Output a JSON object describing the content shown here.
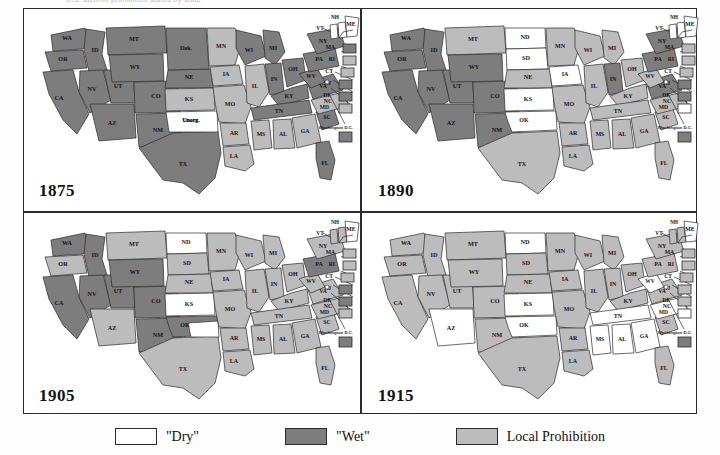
{
  "figure": {
    "top_sliver_text": "U.S. alcohol prohibition status by state",
    "legend": {
      "items": [
        {
          "label": "\"Dry\"",
          "swatch_name": "dry-swatch",
          "color": "#ffffff"
        },
        {
          "label": "\"Wet\"",
          "swatch_name": "wet-swatch",
          "color": "#7d7d7d"
        },
        {
          "label": "Local Prohibition",
          "swatch_name": "local-prohibition-swatch",
          "color": "#bcbcbc"
        }
      ]
    },
    "colors": {
      "dry": "#ffffff",
      "wet": "#7d7d7d",
      "local": "#bcbcbc",
      "outline": "#2b2b2b",
      "frame": "#2b2b2b"
    },
    "inset_box_labels": [
      "MA",
      "RI",
      "CT",
      "NJ",
      "DE",
      "MD"
    ],
    "dc_label": "Washington D.C."
  },
  "panels": [
    {
      "id": "panel-1875",
      "year": "1875",
      "states": {
        "WA": "wet",
        "OR": "wet",
        "ID": "wet",
        "MT": "wet",
        "WY": "wet",
        "CA": "wet",
        "NV": "wet",
        "UT": "wet",
        "CO": "wet",
        "AZ": "wet",
        "NM": "wet",
        "TX": "wet",
        "DAK": "wet",
        "NE": "wet",
        "KS": "local",
        "UNORG": "dry",
        "MN": "local",
        "IA": "local",
        "MO": "local",
        "AR": "local",
        "LA": "local",
        "WI": "wet",
        "IL": "local",
        "MI": "wet",
        "IN": "wet",
        "OH": "wet",
        "KY": "wet",
        "TN": "wet",
        "MS": "local",
        "AL": "local",
        "GA": "local",
        "FL": "wet",
        "SC": "wet",
        "NC": "local",
        "VA": "wet",
        "WV": "wet",
        "PA": "wet",
        "NY": "wet",
        "VT": "dry",
        "NH": "dry",
        "ME": "dry",
        "MA": "wet",
        "RI": "local",
        "CT": "local",
        "NJ": "wet",
        "DE": "wet",
        "MD": "local",
        "DC": "wet"
      },
      "labels": {
        "WA": "WA",
        "OR": "OR",
        "ID": "ID",
        "MT": "MT",
        "WY": "WY",
        "CA": "CA",
        "NV": "NV",
        "UT": "UT",
        "CO": "CO",
        "AZ": "AZ",
        "NM": "NM",
        "TX": "TX",
        "DAK": "Dak.",
        "NE": "NE",
        "KS": "KS",
        "UNORG": "Unorg.",
        "MN": "MN",
        "IA": "IA",
        "MO": "MO",
        "AR": "AR",
        "LA": "LA",
        "WI": "WI",
        "IL": "IL",
        "MI": "MI",
        "IN": "IN",
        "OH": "OH",
        "KY": "KY",
        "TN": "TN",
        "MS": "MS",
        "AL": "AL",
        "GA": "GA",
        "FL": "FL",
        "SC": "SC",
        "NC": "NC",
        "VA": "VA",
        "WV": "WV",
        "PA": "PA",
        "NY": "NY",
        "VT": "VT",
        "NH": "NH",
        "ME": "ME"
      }
    },
    {
      "id": "panel-1890",
      "year": "1890",
      "states": {
        "WA": "wet",
        "OR": "wet",
        "ID": "wet",
        "MT": "local",
        "WY": "wet",
        "CA": "wet",
        "NV": "wet",
        "UT": "wet",
        "CO": "wet",
        "AZ": "wet",
        "NM": "wet",
        "TX": "local",
        "ND": "dry",
        "SD": "dry",
        "NE": "local",
        "KS": "dry",
        "OK": "dry",
        "MN": "local",
        "IA": "dry",
        "MO": "local",
        "AR": "local",
        "LA": "local",
        "WI": "local",
        "IL": "local",
        "MI": "local",
        "IN": "wet",
        "OH": "local",
        "KY": "local",
        "TN": "local",
        "MS": "local",
        "AL": "local",
        "GA": "local",
        "FL": "local",
        "SC": "local",
        "NC": "local",
        "VA": "wet",
        "WV": "local",
        "PA": "wet",
        "NY": "wet",
        "VT": "dry",
        "NH": "dry",
        "ME": "dry",
        "MA": "local",
        "RI": "local",
        "CT": "local",
        "NJ": "wet",
        "DE": "wet",
        "MD": "dry",
        "DC": "wet"
      },
      "labels": {
        "WA": "WA",
        "OR": "OR",
        "ID": "ID",
        "MT": "MT",
        "WY": "WY",
        "CA": "CA",
        "NV": "NV",
        "UT": "UT",
        "CO": "CO",
        "AZ": "AZ",
        "NM": "NM",
        "TX": "TX",
        "ND": "ND",
        "SD": "SD",
        "NE": "NE",
        "KS": "KS",
        "OK": "OK",
        "MN": "MN",
        "IA": "IA",
        "MO": "MO",
        "AR": "AR",
        "LA": "LA",
        "WI": "WI",
        "IL": "IL",
        "MI": "MI",
        "IN": "IN",
        "OH": "OH",
        "KY": "KY",
        "TN": "TN",
        "MS": "MS",
        "AL": "AL",
        "GA": "GA",
        "FL": "FL",
        "SC": "SC",
        "NC": "NC",
        "VA": "VA",
        "WV": "WV",
        "PA": "PA",
        "NY": "NY",
        "VT": "VT",
        "NH": "NH",
        "ME": "ME"
      }
    },
    {
      "id": "panel-1905",
      "year": "1905",
      "states": {
        "WA": "wet",
        "OR": "local",
        "ID": "wet",
        "MT": "local",
        "WY": "wet",
        "CA": "wet",
        "NV": "wet",
        "UT": "wet",
        "CO": "wet",
        "AZ": "local",
        "NM": "wet",
        "TX": "local",
        "ND": "dry",
        "SD": "local",
        "NE": "local",
        "KS": "dry",
        "OK": "wet",
        "IT": "dry",
        "MN": "local",
        "IA": "local",
        "MO": "local",
        "AR": "local",
        "LA": "local",
        "WI": "local",
        "IL": "local",
        "MI": "local",
        "IN": "local",
        "OH": "local",
        "KY": "local",
        "TN": "local",
        "MS": "local",
        "AL": "local",
        "GA": "local",
        "FL": "local",
        "SC": "local",
        "NC": "local",
        "VA": "local",
        "WV": "local",
        "PA": "wet",
        "NY": "local",
        "VT": "local",
        "NH": "local",
        "ME": "dry",
        "MA": "local",
        "RI": "local",
        "CT": "local",
        "NJ": "wet",
        "DE": "wet",
        "MD": "local",
        "DC": "wet"
      },
      "labels": {
        "WA": "WA",
        "OR": "OR",
        "ID": "ID",
        "MT": "MT",
        "WY": "WY",
        "CA": "CA",
        "NV": "NV",
        "UT": "UT",
        "CO": "CO",
        "AZ": "AZ",
        "NM": "NM",
        "TX": "TX",
        "ND": "ND",
        "SD": "SD",
        "NE": "NE",
        "KS": "KS",
        "OK": "OK",
        "MN": "MN",
        "IA": "IA",
        "MO": "MO",
        "AR": "AR",
        "LA": "LA",
        "WI": "WI",
        "IL": "IL",
        "MI": "MI",
        "IN": "IN",
        "OH": "OH",
        "KY": "KY",
        "TN": "TN",
        "MS": "MS",
        "AL": "AL",
        "GA": "GA",
        "FL": "FL",
        "SC": "SC",
        "NC": "NC",
        "VA": "VA",
        "WV": "WV",
        "PA": "PA",
        "NY": "NY",
        "VT": "VT",
        "NH": "NH",
        "ME": "ME"
      }
    },
    {
      "id": "panel-1915",
      "year": "1915",
      "states": {
        "WA": "local",
        "OR": "local",
        "ID": "local",
        "MT": "local",
        "WY": "local",
        "CA": "local",
        "NV": "local",
        "UT": "local",
        "CO": "local",
        "AZ": "dry",
        "NM": "local",
        "TX": "local",
        "ND": "dry",
        "SD": "local",
        "NE": "local",
        "KS": "dry",
        "OK": "dry",
        "MN": "local",
        "IA": "local",
        "MO": "local",
        "AR": "local",
        "LA": "local",
        "WI": "local",
        "IL": "local",
        "MI": "local",
        "IN": "local",
        "OH": "local",
        "KY": "local",
        "TN": "dry",
        "MS": "dry",
        "AL": "dry",
        "GA": "dry",
        "FL": "local",
        "SC": "local",
        "NC": "dry",
        "VA": "local",
        "WV": "dry",
        "PA": "local",
        "NY": "local",
        "VT": "local",
        "NH": "local",
        "ME": "dry",
        "MA": "local",
        "RI": "local",
        "CT": "local",
        "NJ": "local",
        "DE": "local",
        "MD": "dry",
        "DC": "wet"
      },
      "labels": {
        "WA": "WA",
        "OR": "OR",
        "ID": "ID",
        "MT": "MT",
        "WY": "WY",
        "CA": "CA",
        "NV": "NV",
        "UT": "UT",
        "CO": "CO",
        "AZ": "AZ",
        "NM": "NM",
        "TX": "TX",
        "ND": "ND",
        "SD": "SD",
        "NE": "NE",
        "KS": "KS",
        "OK": "OK",
        "MN": "MN",
        "IA": "IA",
        "MO": "MO",
        "AR": "AR",
        "LA": "LA",
        "WI": "WI",
        "IL": "IL",
        "MI": "MI",
        "IN": "IN",
        "OH": "OH",
        "KY": "KY",
        "TN": "TN",
        "MS": "MS",
        "AL": "AL",
        "GA": "GA",
        "FL": "FL",
        "SC": "SC",
        "NC": "NC",
        "VA": "VA",
        "WV": "WV",
        "PA": "PA",
        "NY": "NY",
        "VT": "VT",
        "NH": "NH",
        "ME": "ME"
      }
    }
  ]
}
